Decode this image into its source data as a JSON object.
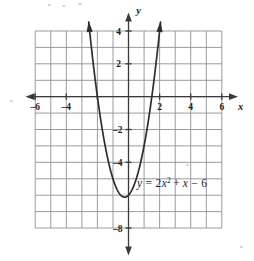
{
  "figure": {
    "name": "parabola-graph",
    "background_color": "#ffffff",
    "grid_color": "#8e9096",
    "axis_color": "#3a3a3c",
    "curve_color": "#2e2e30"
  },
  "axes": {
    "x_axis_label": "x",
    "y_axis_label": "y",
    "x_ticks": [
      {
        "value": -6,
        "label": "–6"
      },
      {
        "value": -4,
        "label": "–4"
      },
      {
        "value": 2,
        "label": "2"
      },
      {
        "value": 4,
        "label": "4"
      },
      {
        "value": 6,
        "label": "6"
      }
    ],
    "y_ticks": [
      {
        "value": 4,
        "label": "4"
      },
      {
        "value": 2,
        "label": "2"
      },
      {
        "value": -2,
        "label": "–2"
      },
      {
        "value": -4,
        "label": "–4"
      },
      {
        "value": -8,
        "label": "–8"
      }
    ]
  },
  "equation": {
    "full_text": "y = 2x² + x − 6",
    "lhs": "y",
    "equals": "=",
    "term1_coeff": "2",
    "term1_var": "x",
    "term1_exponent": "2",
    "plus": "+",
    "term2_var": "x",
    "minus": "−",
    "constant": "6"
  },
  "chart_data": {
    "type": "line",
    "title": "",
    "subtitle": "",
    "xlabel": "x",
    "ylabel": "y",
    "xlim": [
      -7,
      7
    ],
    "ylim": [
      -9,
      5
    ],
    "grid": true,
    "grid_xlim": [
      -6,
      6
    ],
    "grid_ylim": [
      -8,
      4
    ],
    "grid_step": 1,
    "legend": "none",
    "annotations": [
      {
        "text": "y = 2x² + x − 6",
        "x": 1.55,
        "y": -5.5
      }
    ],
    "series": [
      {
        "name": "y = 2x^2 + x - 6",
        "equation": "y = 2*x**2 + x - 6",
        "vertex": [
          -0.25,
          -6.125
        ],
        "x_intercepts": [
          -2,
          1.5
        ],
        "y_intercept": -6,
        "domain_drawn": [
          -2.56,
          2.06
        ],
        "x": [
          -2.56,
          -2.4,
          -2.2,
          -2.0,
          -1.8,
          -1.6,
          -1.4,
          -1.2,
          -1.0,
          -0.8,
          -0.6,
          -0.4,
          -0.25,
          -0.2,
          0.0,
          0.2,
          0.4,
          0.6,
          0.8,
          1.0,
          1.2,
          1.4,
          1.5,
          1.6,
          1.8,
          2.0,
          2.06
        ],
        "y": [
          4.55,
          3.12,
          1.88,
          0.0,
          -1.32,
          -2.48,
          -3.48,
          -4.32,
          -5.0,
          -5.52,
          -5.88,
          -6.08,
          -6.125,
          -6.12,
          -6.0,
          -5.72,
          -5.28,
          -4.68,
          -3.92,
          -3.0,
          -1.92,
          -0.68,
          0.0,
          0.72,
          2.28,
          4.0,
          4.55
        ]
      }
    ]
  }
}
